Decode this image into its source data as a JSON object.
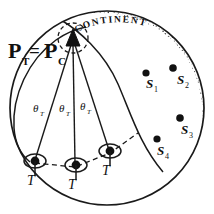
{
  "figure": {
    "background_color": "#ffffff",
    "ink_color": "#1a1a1a",
    "stipple_color": "#4a4a4a",
    "continent_label": "CONTINENT",
    "apex_label": {
      "main_left": "P",
      "sub_left": "T",
      "equals": "=",
      "main_right": "P",
      "sub_right": "C",
      "full": "Pᴛ = Pᴄ"
    },
    "angle_labels": [
      {
        "symbol": "θ",
        "subscript": "T",
        "full": "θT"
      },
      {
        "symbol": "θ",
        "subscript": "T",
        "full": "θT"
      },
      {
        "symbol": "θ",
        "subscript": "T",
        "full": "θT"
      }
    ],
    "station_labels": [
      {
        "label": "T"
      },
      {
        "label": "T"
      },
      {
        "label": "T"
      }
    ],
    "source_points": [
      {
        "label": "S",
        "subscript": "1",
        "full": "S1"
      },
      {
        "label": "S",
        "subscript": "2",
        "full": "S2"
      },
      {
        "label": "S",
        "subscript": "3",
        "full": "S3"
      },
      {
        "label": "S",
        "subscript": "4",
        "full": "S4"
      }
    ]
  }
}
